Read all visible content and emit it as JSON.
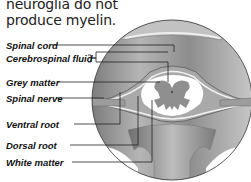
{
  "intro": {
    "line1": "neuroglia do not",
    "line2": "produce myelin."
  },
  "diagram": {
    "labels": [
      {
        "id": "spinal-cord",
        "text": "Spinal cord"
      },
      {
        "id": "cerebrospinal-fluid",
        "text": "Cerebrospinal fluid"
      },
      {
        "id": "grey-matter",
        "text": "Grey matter"
      },
      {
        "id": "spinal-nerve",
        "text": "Spinal nerve"
      },
      {
        "id": "ventral-root",
        "text": "Ventral root"
      },
      {
        "id": "dorsal-root",
        "text": "Dorsal root"
      },
      {
        "id": "white-matter",
        "text": "White matter"
      }
    ],
    "colors": {
      "bone": "#b8b8b8",
      "tissue": "#9a9a9a",
      "grey_matter": "#8f8f8f",
      "white_matter": "#ffffff",
      "leader_line": "#222222"
    }
  }
}
